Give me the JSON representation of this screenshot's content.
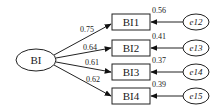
{
  "diagram": {
    "latent": {
      "label": "BI"
    },
    "indicators": [
      {
        "label": "BI1",
        "loading": "0.75",
        "r2": "0.56",
        "error": "e12"
      },
      {
        "label": "BI2",
        "loading": "0.64",
        "r2": "0.41",
        "error": "e13"
      },
      {
        "label": "BI3",
        "loading": "0.61",
        "r2": "0.37",
        "error": "e14"
      },
      {
        "label": "BI4",
        "loading": "0.62",
        "r2": "0.39",
        "error": "e15"
      }
    ]
  }
}
